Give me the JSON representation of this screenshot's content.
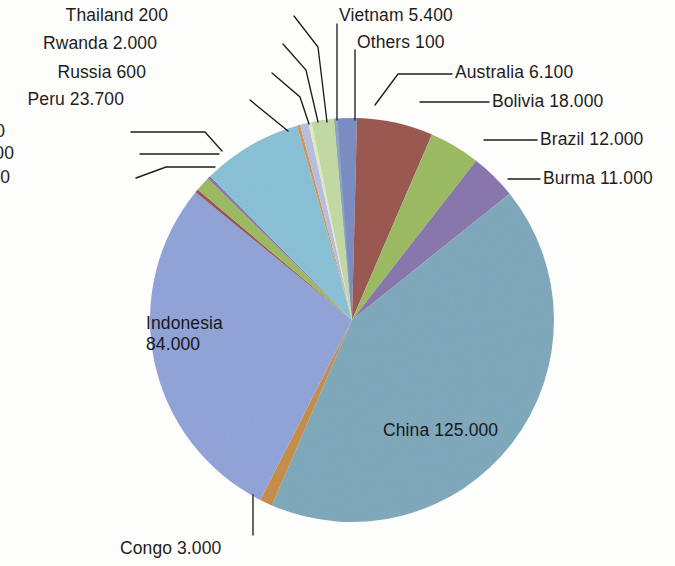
{
  "chart_data": {
    "type": "pie",
    "title": "",
    "subtitle": "",
    "xlabel": "",
    "ylabel": "",
    "legend_position": "callout-labels",
    "grid": false,
    "value_format": "european-thousands-dot",
    "categories": [
      "China",
      "Indonesia",
      "Peru",
      "Bolivia",
      "Brazil",
      "Burma",
      "Australia",
      "Vietnam",
      "Malaysia",
      "Congo",
      "Rwanda",
      "Laos",
      "Russia",
      "Nigeria",
      "Thailand",
      "Others"
    ],
    "values": [
      125000,
      84000,
      23700,
      18000,
      12000,
      11000,
      6100,
      5400,
      3500,
      3000,
      2000,
      800,
      600,
      500,
      200,
      100
    ],
    "total": 295900,
    "slices": [
      {
        "name": "Australia",
        "value": 6100,
        "value_text": "6.100",
        "label": "Australia 6.100",
        "color": "#7d8fc4"
      },
      {
        "name": "Bolivia",
        "value": 18000,
        "value_text": "18.000",
        "label": "Bolivia 18.000",
        "color": "#9c5a52"
      },
      {
        "name": "Brazil",
        "value": 12000,
        "value_text": "12.000",
        "label": "Brazil 12.000",
        "color": "#9dbd64"
      },
      {
        "name": "Burma",
        "value": 11000,
        "value_text": "11.000",
        "label": "Burma 11.000",
        "color": "#8a79ae"
      },
      {
        "name": "China",
        "value": 125000,
        "value_text": "125.000",
        "label": "China 125.000",
        "color": "#81abbe"
      },
      {
        "name": "Congo",
        "value": 3000,
        "value_text": "3.000",
        "label": "Congo 3.000",
        "color": "#c98f4d"
      },
      {
        "name": "Indonesia",
        "value": 84000,
        "value_text": "84.000",
        "label": "Indonesia 84.000",
        "color": "#93a5da"
      },
      {
        "name": "Laos",
        "value": 800,
        "value_text": "800",
        "label": "Laos 800",
        "color": "#9c5a52"
      },
      {
        "name": "Malaysia",
        "value": 3500,
        "value_text": "3.500",
        "label": "Malaysia 3.500",
        "color": "#9dbd64"
      },
      {
        "name": "Nigeria",
        "value": 500,
        "value_text": "500",
        "label": "Nigeria 500",
        "color": "#8a79ae"
      },
      {
        "name": "Peru",
        "value": 23700,
        "value_text": "23.700",
        "label": "Peru 23.700",
        "color": "#8cc3d8"
      },
      {
        "name": "Russia",
        "value": 600,
        "value_text": "600",
        "label": "Russia 600",
        "color": "#d19a5d"
      },
      {
        "name": "Rwanda",
        "value": 2000,
        "value_text": "2.000",
        "label": "Rwanda 2.000",
        "color": "#b9c0e2"
      },
      {
        "name": "Thailand",
        "value": 200,
        "value_text": "200",
        "label": "Thailand 200",
        "color": "#e2ecc4"
      },
      {
        "name": "Vietnam",
        "value": 5400,
        "value_text": "5.400",
        "label": "Vietnam 5.400",
        "color": "#c5dca6"
      },
      {
        "name": "Others",
        "value": 100,
        "value_text": "100",
        "label": "Others 100",
        "color": "#8fa7cd"
      }
    ],
    "draw_order": [
      "Australia",
      "Bolivia",
      "Brazil",
      "Burma",
      "China",
      "Congo",
      "Indonesia",
      "Laos",
      "Malaysia",
      "Nigeria",
      "Peru",
      "Russia",
      "Rwanda",
      "Thailand",
      "Vietnam",
      "Others"
    ]
  },
  "labels": {
    "thailand": "Thailand 200",
    "rwanda": "Rwanda 2.000",
    "russia": "Russia 600",
    "peru": "Peru 23.700",
    "nigeria": "Nigeria 500",
    "malaysia": "Malaysia 3.500",
    "laos": "Laos 800",
    "vietnam": "Vietnam 5.400",
    "others": "Others 100",
    "australia": "Australia 6.100",
    "bolivia": "Bolivia 18.000",
    "brazil": "Brazil 12.000",
    "burma": "Burma 11.000",
    "indonesia_name": "Indonesia",
    "indonesia_value": "84.000",
    "china": "China 125.000",
    "congo": "Congo 3.000"
  }
}
